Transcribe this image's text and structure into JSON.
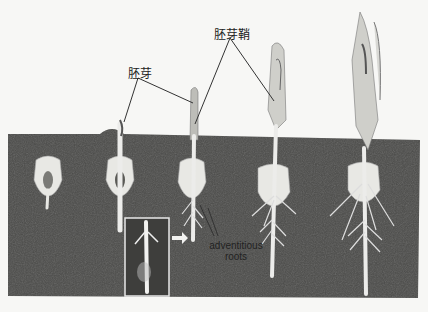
{
  "diagram": {
    "labels": {
      "plumule": "胚芽",
      "coleoptile": "胚芽鞘",
      "adventitious_roots_line1": "adventitious",
      "adventitious_roots_line2": "roots"
    },
    "stages": [
      {
        "name": "stage-1-seed"
      },
      {
        "name": "stage-2-emerging"
      },
      {
        "name": "stage-3-plumule"
      },
      {
        "name": "stage-4-coleoptile"
      },
      {
        "name": "stage-5-seedling"
      }
    ],
    "colors": {
      "soil": "#4a4a48",
      "background": "#f7f7f5",
      "plant": "#e6e6e2",
      "leader_line": "#333333",
      "inset_border": "#e8e8e8"
    }
  }
}
